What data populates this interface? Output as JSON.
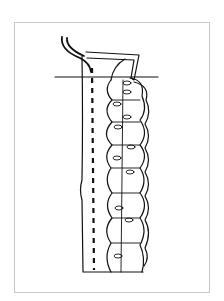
{
  "figure": {
    "colors": {
      "ink": "#111111",
      "frame": "#c8c8c8",
      "background": "#ffffff"
    },
    "scallop_count": 8,
    "loop_stitch_count": 9
  }
}
